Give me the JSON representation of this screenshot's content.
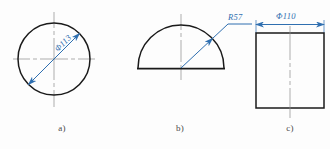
{
  "drawing": {
    "title": "Engineering dimensioning examples",
    "background_color": "#fdfdfd",
    "geometry_color": "#1a1a1a",
    "dimension_color": "#2f6fb0",
    "centerline_color": "#8a8a8a"
  },
  "figures": [
    {
      "id": "a",
      "caption": "a)",
      "shape": "circle",
      "dimension_label": "Φ113",
      "dimension_type": "diameter",
      "annotation_style": "diagonal-double-arrow"
    },
    {
      "id": "b",
      "caption": "b)",
      "shape": "semicircle",
      "dimension_label": "R57",
      "dimension_type": "radius",
      "annotation_style": "leader-with-arrow"
    },
    {
      "id": "c",
      "caption": "c)",
      "shape": "rectangle",
      "dimension_label": "Φ110",
      "dimension_type": "diameter",
      "annotation_style": "horizontal-dimension-line"
    }
  ]
}
